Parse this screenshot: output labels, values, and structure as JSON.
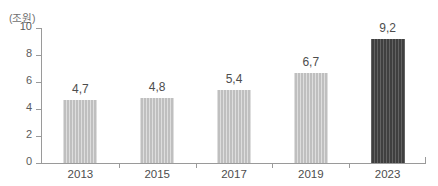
{
  "chart_data": {
    "type": "bar",
    "title": "",
    "subtitle": "",
    "unit_label": "(조원)",
    "xlabel": "",
    "ylabel": "",
    "categories": [
      "2013",
      "2015",
      "2017",
      "2019",
      "2023"
    ],
    "values": [
      4.7,
      4.8,
      5.4,
      6.7,
      9.2
    ],
    "value_labels": [
      "4,7",
      "4,8",
      "5,4",
      "6,7",
      "9,2"
    ],
    "series": [
      {
        "name": "",
        "values": [
          4.7,
          4.8,
          5.4,
          6.7,
          9.2
        ]
      }
    ],
    "ylim": [
      0,
      10
    ],
    "y_ticks": [
      0,
      2,
      4,
      6,
      8,
      10
    ],
    "y_tick_labels": [
      "0",
      "2",
      "4",
      "6",
      "8",
      "10"
    ],
    "grid": false,
    "legend": false,
    "legend_position": "none",
    "bar_colors": [
      "#c6c6c6",
      "#c6c6c6",
      "#c6c6c6",
      "#c6c6c6",
      "#4b4b4b"
    ],
    "highlight_index": 4,
    "axis_color": "#9a9a9a",
    "text_color": "#4d4d4d",
    "background": "#ffffff"
  }
}
